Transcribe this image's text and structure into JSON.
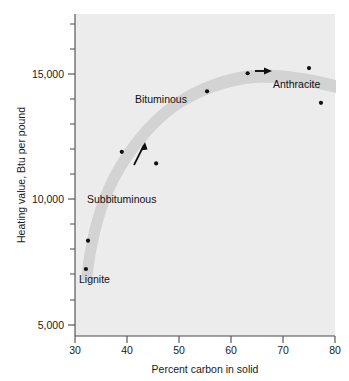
{
  "chart_data": {
    "type": "scatter",
    "title": "",
    "xlabel": "Percent carbon in solid",
    "ylabel": "Heating value, Btu per pound",
    "xlim": [
      30,
      80
    ],
    "ylim": [
      5000,
      17500
    ],
    "grid": false,
    "legend": "none",
    "x_ticks": [
      30,
      40,
      50,
      60,
      70,
      80
    ],
    "x_tick_labels": [
      "30",
      "40",
      "50",
      "60",
      "70",
      "80"
    ],
    "x_minor_ticks": [
      35,
      45,
      55,
      65,
      75
    ],
    "y_ticks": [
      5000,
      10000,
      15000
    ],
    "y_tick_labels": [
      "5,000",
      "10,000",
      "15,000"
    ],
    "y_minor_ticks": [
      6000,
      7000,
      8000,
      9000,
      11000,
      12000,
      13000,
      14000,
      16000,
      17000
    ],
    "points": [
      {
        "x": 32.1,
        "y": 7600
      },
      {
        "x": 32.5,
        "y": 8700
      },
      {
        "x": 39.0,
        "y": 12150
      },
      {
        "x": 45.6,
        "y": 11700
      },
      {
        "x": 55.4,
        "y": 14500
      },
      {
        "x": 63.2,
        "y": 15200
      },
      {
        "x": 75.0,
        "y": 15400
      },
      {
        "x": 77.3,
        "y": 14050
      }
    ],
    "trend_band": {
      "description": "shaded grey band following coal rank progression",
      "path_points": [
        {
          "x": 31.4,
          "y": 7150
        },
        {
          "x": 33.5,
          "y": 9200
        },
        {
          "x": 38.5,
          "y": 11500
        },
        {
          "x": 45.0,
          "y": 13200
        },
        {
          "x": 52.0,
          "y": 14400
        },
        {
          "x": 60.0,
          "y": 15250
        },
        {
          "x": 68.0,
          "y": 15450
        },
        {
          "x": 80.0,
          "y": 14750
        }
      ]
    },
    "annotations": [
      {
        "label": "Lignite",
        "x": 31.8,
        "y": 6700
      },
      {
        "label": "Subbituminous",
        "x": 33.4,
        "y": 10000
      },
      {
        "label": "Bituminous",
        "x": 41.5,
        "y": 13700
      },
      {
        "label": "Anthracite",
        "x": 68.5,
        "y": 14850
      }
    ],
    "arrows": [
      {
        "from": {
          "x": 41.3,
          "y": 11350
        },
        "to": {
          "x": 43.3,
          "y": 12150
        },
        "direction": "up-right"
      },
      {
        "from": {
          "x": 64.9,
          "y": 15400
        },
        "to": {
          "x": 68.3,
          "y": 15400
        },
        "direction": "right"
      }
    ]
  },
  "colors": {
    "plot_background": "#ececed",
    "page_background": "#ffffff",
    "axis": "#4a4a4a",
    "point": "#111111",
    "band": "#d2d2d2",
    "text": "#1a1a1a"
  }
}
